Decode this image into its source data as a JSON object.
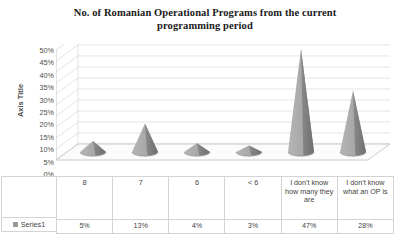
{
  "chart_data": {
    "type": "bar",
    "subtype": "3d-cone",
    "title": "No. of Romanian Operational Programs from the current programming period",
    "title_line1": "No. of Romanian Operational Programs from the current",
    "title_line2": "programming period",
    "xlabel": "",
    "ylabel": "Axis Title",
    "categories": [
      "8",
      "7",
      "6",
      "< 6",
      "I don't know how many they are",
      "I don't know what an OP is"
    ],
    "series": [
      {
        "name": "Series1",
        "values": [
          5,
          13,
          4,
          3,
          47,
          28
        ],
        "value_labels": [
          "5%",
          "13%",
          "4%",
          "3%",
          "47%",
          "28%"
        ],
        "color": "#a6a6a6",
        "shade_color": "#7f7f7f"
      }
    ],
    "ylim": [
      0,
      50
    ],
    "ytick_values": [
      50,
      45,
      40,
      35,
      30,
      25,
      20,
      15,
      10,
      5,
      0
    ],
    "ytick_labels": [
      "50%",
      "45%",
      "40%",
      "35%",
      "30%",
      "25%",
      "20%",
      "15%",
      "10%",
      "5%",
      "0%"
    ],
    "grid": true,
    "legend_position": "data-table",
    "data_table_visible": true,
    "colors": {
      "gridline": "#d9d9d9",
      "axis": "#bfbfbf",
      "table_border": "#d4d4d4",
      "text": "#3f3f3f",
      "title_text": "#1a1a1a",
      "plot_background": "#ffffff",
      "series_light": "#a6a6a6",
      "series_dark": "#7f7f7f",
      "floor": "#fbfbfb",
      "legend_swatch": "#9a9a9a"
    }
  },
  "table": {
    "legend_label": "Series1"
  }
}
